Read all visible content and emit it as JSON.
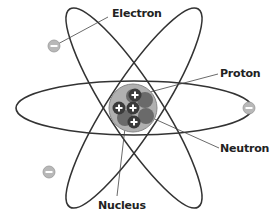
{
  "diagram": {
    "labels": {
      "electron": "Electron",
      "proton": "Proton",
      "neutron": "Neutron",
      "nucleus": "Nucleus"
    },
    "electron_symbol": "−",
    "proton_symbol": "+",
    "orbits": 3,
    "electrons": 3,
    "colors": {
      "orbit": "#333333",
      "nucleus_bg": "#a9a9a9",
      "proton": "#3a3a3a",
      "neutron": "#6e6e6e",
      "electron": "#b5b5b5",
      "leader_line": "#444444"
    }
  }
}
